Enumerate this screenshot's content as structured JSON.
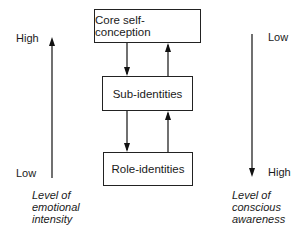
{
  "diagram": {
    "boxes": [
      {
        "id": "core",
        "label": "Core self-conception"
      },
      {
        "id": "sub",
        "label": "Sub-identities"
      },
      {
        "id": "role",
        "label": "Role-identities"
      }
    ],
    "left_axis": {
      "top_label": "High",
      "bottom_label": "Low",
      "direction": "up",
      "caption": [
        "Level of",
        "emotional",
        "intensity"
      ]
    },
    "right_axis": {
      "top_label": "Low",
      "bottom_label": "High",
      "direction": "down",
      "caption": [
        "Level of",
        "conscious",
        "awareness"
      ]
    }
  }
}
